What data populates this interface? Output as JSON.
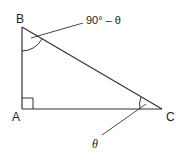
{
  "diagram": {
    "type": "right-triangle",
    "vertices": {
      "A": {
        "label": "A"
      },
      "B": {
        "label": "B"
      },
      "C": {
        "label": "C"
      }
    },
    "angles": {
      "at_A": {
        "marker": "right-angle"
      },
      "at_B": {
        "label": "90° – θ"
      },
      "at_C": {
        "label": "θ"
      }
    },
    "stroke_color": "#333333"
  }
}
